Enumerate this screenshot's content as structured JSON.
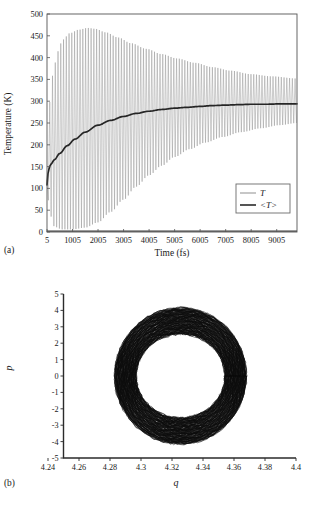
{
  "figure": {
    "panel_a_label": "(a)",
    "panel_b_label": "(b)"
  },
  "chart_data": [
    {
      "id": "panel-a",
      "type": "line",
      "title": "",
      "xlabel": "Time (fs)",
      "ylabel": "Temperature (K)",
      "xlim": [
        5,
        9800
      ],
      "ylim": [
        0,
        500
      ],
      "grid": false,
      "frame": "box",
      "xticks": [
        5,
        1005,
        2005,
        3005,
        4005,
        5005,
        6005,
        7005,
        8005,
        9005
      ],
      "xticklabels": [
        "5",
        "1005",
        "2005",
        "3005",
        "4005",
        "5005",
        "6005",
        "7005",
        "8005",
        "9005"
      ],
      "yticks": [
        0,
        50,
        100,
        150,
        200,
        250,
        300,
        350,
        400,
        450,
        500
      ],
      "yticklabels": [
        "0",
        "50",
        "100",
        "150",
        "200",
        "250",
        "300",
        "350",
        "400",
        "450",
        "500"
      ],
      "legend": {
        "position": "lower-right",
        "entries": [
          {
            "label": "T",
            "color": "#b9b9b9",
            "name": "instantaneous-temperature"
          },
          {
            "label": "<T>",
            "color": "#2b2b2b",
            "name": "average-temperature"
          }
        ]
      },
      "series": [
        {
          "name": "T",
          "kind": "oscillation-envelope",
          "color": "#8d8d8d",
          "period_fs": 108,
          "envelope_upper": [
            {
              "x": 5,
              "y": 120
            },
            {
              "x": 120,
              "y": 300
            },
            {
              "x": 260,
              "y": 372
            },
            {
              "x": 420,
              "y": 414
            },
            {
              "x": 620,
              "y": 441
            },
            {
              "x": 900,
              "y": 456
            },
            {
              "x": 1250,
              "y": 464
            },
            {
              "x": 1600,
              "y": 468
            },
            {
              "x": 1900,
              "y": 466
            },
            {
              "x": 2300,
              "y": 458
            },
            {
              "x": 2800,
              "y": 446
            },
            {
              "x": 3300,
              "y": 433
            },
            {
              "x": 3900,
              "y": 420
            },
            {
              "x": 4500,
              "y": 408
            },
            {
              "x": 5100,
              "y": 398
            },
            {
              "x": 5800,
              "y": 388
            },
            {
              "x": 6500,
              "y": 378
            },
            {
              "x": 7200,
              "y": 370
            },
            {
              "x": 8000,
              "y": 362
            },
            {
              "x": 8800,
              "y": 357
            },
            {
              "x": 9800,
              "y": 352
            }
          ],
          "envelope_lower": [
            {
              "x": 5,
              "y": 100
            },
            {
              "x": 120,
              "y": 40
            },
            {
              "x": 300,
              "y": 12
            },
            {
              "x": 600,
              "y": 6
            },
            {
              "x": 1000,
              "y": 6
            },
            {
              "x": 1500,
              "y": 10
            },
            {
              "x": 2000,
              "y": 22
            },
            {
              "x": 2500,
              "y": 46
            },
            {
              "x": 3000,
              "y": 74
            },
            {
              "x": 3500,
              "y": 104
            },
            {
              "x": 4000,
              "y": 130
            },
            {
              "x": 4500,
              "y": 152
            },
            {
              "x": 5000,
              "y": 172
            },
            {
              "x": 5600,
              "y": 190
            },
            {
              "x": 6200,
              "y": 205
            },
            {
              "x": 6900,
              "y": 218
            },
            {
              "x": 7600,
              "y": 229
            },
            {
              "x": 8400,
              "y": 238
            },
            {
              "x": 9100,
              "y": 245
            },
            {
              "x": 9800,
              "y": 250
            }
          ]
        },
        {
          "name": "<T>",
          "kind": "running-average",
          "color": "#262626",
          "points": [
            {
              "x": 5,
              "y": 108
            },
            {
              "x": 60,
              "y": 142
            },
            {
              "x": 150,
              "y": 155
            },
            {
              "x": 300,
              "y": 166
            },
            {
              "x": 500,
              "y": 180
            },
            {
              "x": 800,
              "y": 198
            },
            {
              "x": 1100,
              "y": 213
            },
            {
              "x": 1500,
              "y": 229
            },
            {
              "x": 2000,
              "y": 245
            },
            {
              "x": 2500,
              "y": 256
            },
            {
              "x": 3000,
              "y": 265
            },
            {
              "x": 3500,
              "y": 272
            },
            {
              "x": 4000,
              "y": 277
            },
            {
              "x": 4500,
              "y": 281
            },
            {
              "x": 5000,
              "y": 284
            },
            {
              "x": 5500,
              "y": 286
            },
            {
              "x": 6000,
              "y": 288
            },
            {
              "x": 6500,
              "y": 290
            },
            {
              "x": 7000,
              "y": 291
            },
            {
              "x": 7500,
              "y": 292
            },
            {
              "x": 8000,
              "y": 293
            },
            {
              "x": 8600,
              "y": 293
            },
            {
              "x": 9200,
              "y": 294
            },
            {
              "x": 9800,
              "y": 294
            }
          ]
        }
      ]
    },
    {
      "id": "panel-b",
      "type": "scatter",
      "title": "",
      "xlabel": "q",
      "ylabel": "p",
      "xlim": [
        4.24,
        4.4
      ],
      "ylim": [
        -5,
        5
      ],
      "grid": false,
      "frame": "left-bottom",
      "xticks": [
        4.24,
        4.26,
        4.28,
        4.3,
        4.32,
        4.34,
        4.36,
        4.38,
        4.4
      ],
      "xticklabels": [
        "4.24",
        "4.26",
        "4.28",
        "4.3",
        "4.32",
        "4.34",
        "4.36",
        "4.38",
        "4.4"
      ],
      "yticks": [
        -5,
        -4,
        -3,
        -2,
        -1,
        0,
        1,
        2,
        3,
        4,
        5
      ],
      "yticklabels": [
        "-5",
        "-4",
        "-3",
        "-2",
        "-1",
        "0",
        "1",
        "2",
        "3",
        "4",
        "5"
      ],
      "orbit_band": {
        "color": "#0d0d0d",
        "center_q": 4.3255,
        "center_p": 0.0,
        "inner_rq": 0.0285,
        "outer_rq": 0.0425,
        "inner_rp": 2.55,
        "outer_rp": 4.15,
        "n_orbits": 150,
        "jitter_q": 0.0006,
        "jitter_p": 0.08
      }
    }
  ]
}
